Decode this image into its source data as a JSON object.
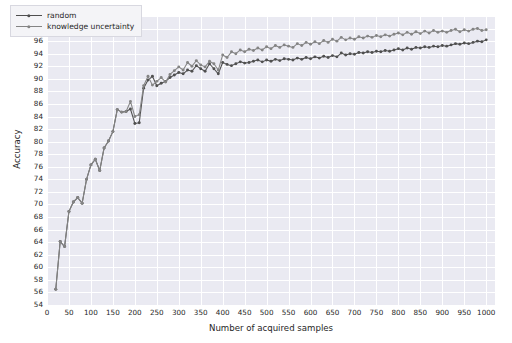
{
  "chart_data": {
    "type": "line",
    "title": "",
    "xlabel": "Number of acquired samples",
    "ylabel": "Accuracy",
    "xlim": [
      0,
      1020
    ],
    "ylim": [
      54,
      100
    ],
    "xticks": [
      0,
      50,
      100,
      150,
      200,
      250,
      300,
      350,
      400,
      450,
      500,
      550,
      600,
      650,
      700,
      750,
      800,
      850,
      900,
      950,
      1000
    ],
    "yticks": [
      54,
      56,
      58,
      60,
      62,
      64,
      66,
      68,
      70,
      72,
      74,
      76,
      78,
      80,
      82,
      84,
      86,
      88,
      90,
      92,
      94,
      96,
      98,
      100
    ],
    "grid": true,
    "legend_position": "upper left",
    "background_color": "#eaeaf2",
    "grid_color": "#ffffff",
    "x": [
      20,
      30,
      40,
      50,
      60,
      70,
      80,
      90,
      100,
      110,
      120,
      130,
      140,
      150,
      160,
      170,
      180,
      190,
      200,
      210,
      220,
      230,
      240,
      250,
      260,
      270,
      280,
      290,
      300,
      310,
      320,
      330,
      340,
      350,
      360,
      370,
      380,
      390,
      400,
      410,
      420,
      430,
      440,
      450,
      460,
      470,
      480,
      490,
      500,
      510,
      520,
      530,
      540,
      550,
      560,
      570,
      580,
      590,
      600,
      610,
      620,
      630,
      640,
      650,
      660,
      670,
      680,
      690,
      700,
      710,
      720,
      730,
      740,
      750,
      760,
      770,
      780,
      790,
      800,
      810,
      820,
      830,
      840,
      850,
      860,
      870,
      880,
      890,
      900,
      910,
      920,
      930,
      940,
      950,
      960,
      970,
      980,
      990,
      1000
    ],
    "series": [
      {
        "name": "random",
        "color": "#4f4f4f",
        "marker": "circle",
        "values": [
          56.5,
          64.1,
          63.3,
          68.9,
          70.4,
          71.1,
          70.2,
          74.0,
          76.3,
          77.2,
          75.4,
          79.0,
          80.1,
          81.6,
          85.1,
          84.7,
          84.8,
          85.2,
          82.9,
          83.0,
          88.5,
          89.8,
          90.4,
          88.9,
          89.3,
          89.6,
          90.2,
          90.6,
          91.0,
          90.8,
          91.4,
          91.2,
          92.1,
          91.6,
          91.2,
          92.4,
          91.6,
          90.8,
          92.6,
          92.3,
          92.1,
          92.4,
          92.7,
          92.5,
          92.6,
          92.8,
          93.0,
          92.7,
          93.0,
          92.8,
          93.1,
          92.9,
          93.2,
          93.1,
          93.0,
          93.3,
          93.1,
          93.4,
          93.2,
          93.5,
          93.3,
          93.6,
          93.4,
          93.7,
          93.5,
          94.1,
          93.8,
          94.0,
          93.9,
          94.2,
          94.1,
          94.3,
          94.2,
          94.4,
          94.3,
          94.5,
          94.4,
          94.6,
          94.8,
          94.6,
          94.9,
          94.7,
          95.0,
          94.9,
          95.1,
          95.0,
          95.2,
          95.1,
          95.3,
          95.2,
          95.4,
          95.6,
          95.5,
          95.7,
          95.6,
          95.8,
          96.0,
          95.9,
          96.2
        ]
      },
      {
        "name": "knowledge uncertainty",
        "color": "#848484",
        "marker": "circle",
        "values": [
          56.5,
          64.1,
          63.3,
          68.9,
          70.4,
          71.1,
          70.2,
          74.0,
          76.3,
          77.2,
          75.4,
          79.0,
          80.1,
          81.6,
          85.1,
          84.7,
          84.8,
          86.4,
          84.0,
          84.3,
          88.9,
          90.4,
          89.0,
          89.6,
          90.2,
          89.5,
          90.7,
          91.3,
          91.9,
          91.4,
          92.6,
          92.0,
          92.9,
          92.2,
          91.9,
          92.8,
          92.4,
          91.4,
          93.8,
          93.4,
          94.3,
          94.0,
          94.6,
          94.3,
          94.7,
          94.5,
          94.9,
          94.6,
          95.1,
          94.8,
          95.3,
          95.0,
          95.4,
          95.2,
          95.0,
          95.6,
          95.3,
          95.8,
          95.5,
          95.9,
          95.6,
          96.1,
          95.8,
          96.3,
          96.0,
          96.6,
          96.2,
          96.5,
          96.3,
          96.7,
          96.5,
          96.8,
          96.6,
          96.9,
          96.7,
          97.0,
          96.8,
          97.1,
          97.3,
          97.0,
          97.4,
          97.1,
          97.5,
          97.2,
          97.6,
          97.3,
          97.7,
          97.4,
          97.6,
          97.4,
          97.7,
          97.9,
          97.5,
          97.8,
          97.6,
          97.9,
          98.0,
          97.7,
          97.8
        ]
      }
    ]
  },
  "legend": {
    "entries": [
      {
        "label": "random"
      },
      {
        "label": "knowledge uncertainty"
      }
    ]
  },
  "axes": {
    "xlabel": "Number of acquired samples",
    "ylabel": "Accuracy"
  }
}
